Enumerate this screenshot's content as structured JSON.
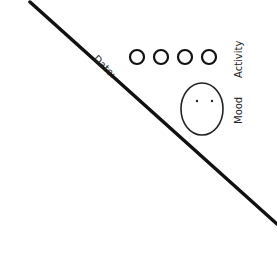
{
  "labels": {
    "date": "Date:",
    "activity": "Activity",
    "mood": "Mood"
  },
  "activity_circles": [
    {
      "cx": 137,
      "cy": 57,
      "r": 7
    },
    {
      "cx": 161,
      "cy": 57,
      "r": 7
    },
    {
      "cx": 185,
      "cy": 57,
      "r": 7
    },
    {
      "cx": 209,
      "cy": 57,
      "r": 7
    }
  ],
  "colors": {
    "ink": "#111111",
    "background": "#ffffff"
  }
}
